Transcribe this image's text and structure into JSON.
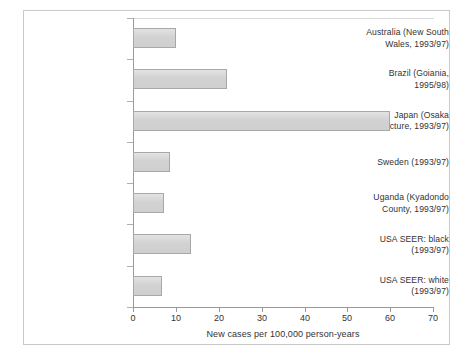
{
  "chart_data": {
    "type": "bar",
    "orientation": "horizontal",
    "title": "",
    "xlabel": "New cases per 100,000 person-years",
    "ylabel": "",
    "xlim": [
      0,
      70
    ],
    "xticks": [
      0,
      10,
      20,
      30,
      40,
      50,
      60,
      70
    ],
    "grid": false,
    "legend": null,
    "categories": [
      "Australia (New South Wales, 1993/97)",
      "Brazil (Goiania, 1995/98)",
      "Japan (Osaka prefecture, 1993/97)",
      "Sweden (1993/97)",
      "Uganda (Kyadondo County, 1993/97)",
      "USA SEER: black (1993/97)",
      "USA SEER: white (1993/97)"
    ],
    "category_lines": [
      [
        "Australia (New South",
        "Wales, 1993/97)"
      ],
      [
        "Brazil (Goiania,",
        "1995/98)"
      ],
      [
        "Japan (Osaka",
        "prefecture, 1993/97)"
      ],
      [
        "Sweden (1993/97)"
      ],
      [
        "Uganda (Kyadondo",
        "County, 1993/97)"
      ],
      [
        "USA SEER: black",
        "(1993/97)"
      ],
      [
        "USA SEER: white",
        "(1993/97)"
      ]
    ],
    "values": [
      10.0,
      22.0,
      60.0,
      8.6,
      7.2,
      13.6,
      6.8
    ],
    "bar_fill_color": "#d2d2d2",
    "bar_border_color": "#a8a8a8",
    "axis_color": "#9a9a9a",
    "text_color": "#333333",
    "border_color": "#c9c9c9",
    "background_color": "#ffffff"
  }
}
